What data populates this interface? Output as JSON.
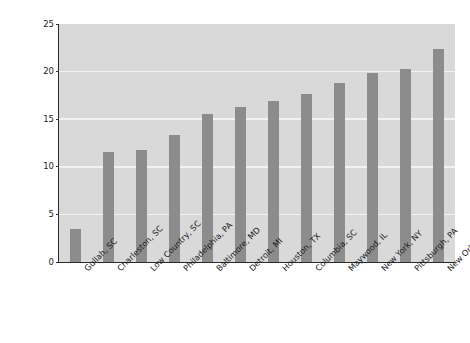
{
  "chart_data": {
    "type": "bar",
    "title": "",
    "subtitle": "",
    "xlabel": "",
    "ylabel": "European ancestry (%)",
    "categories": [
      "Gullah, SC",
      "Charleston, SC",
      "Low Country, SC",
      "Philadelphia, PA",
      "Baltimore, MD",
      "Detroit, MI",
      "Houston, TX",
      "Columbia, SC",
      "Maywood, IL",
      "New York, NY",
      "Pittsburgh, PA",
      "New Orleans, LA"
    ],
    "values": [
      3.5,
      11.6,
      11.8,
      13.3,
      15.6,
      16.3,
      16.9,
      17.7,
      18.8,
      19.9,
      20.3,
      22.4
    ],
    "ylim": [
      0,
      25
    ],
    "yticks": [
      0,
      5,
      10,
      15,
      20,
      25
    ],
    "ytick_labels": [
      "0",
      "5",
      "10",
      "15",
      "20",
      "25"
    ],
    "grid": true,
    "grid_axis": "y",
    "legend": false,
    "legend_position": "none",
    "bar_color": "#8c8c8c",
    "plot_background": "#d9d9d9",
    "gridline_color": "#f2f2f2",
    "axis_color": "#2b2b2b",
    "figure_background": "#ffffff",
    "xtick_rotation": -45
  }
}
